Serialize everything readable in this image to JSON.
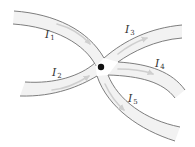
{
  "diagram": {
    "type": "current-junction",
    "junction": {
      "x": 101,
      "y": 67,
      "color": "#111111"
    },
    "colors": {
      "wire_fill": "#f2f2f2",
      "wire_edge": "#6f6f6f",
      "arrow": "#cfcfcf",
      "label": "#333333"
    },
    "currents": [
      {
        "id": "I1",
        "symbol": "I",
        "subscript": "1",
        "direction": "into-junction"
      },
      {
        "id": "I2",
        "symbol": "I",
        "subscript": "2",
        "direction": "into-junction"
      },
      {
        "id": "I3",
        "symbol": "I",
        "subscript": "3",
        "direction": "out-of-junction"
      },
      {
        "id": "I4",
        "symbol": "I",
        "subscript": "4",
        "direction": "out-of-junction"
      },
      {
        "id": "I5",
        "symbol": "I",
        "subscript": "5",
        "direction": "out-of-junction"
      }
    ]
  }
}
